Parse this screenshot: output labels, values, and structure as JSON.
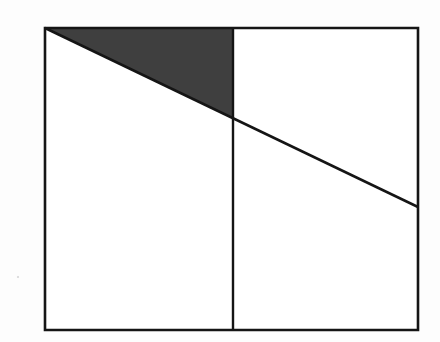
{
  "figure": {
    "canvas": {
      "width": 440,
      "height": 342,
      "background_color": "#fdfdfd"
    },
    "colors": {
      "stroke": "#151515",
      "shaded_fill": "#3f3f3f",
      "unshaded_fill": "#ffffff",
      "paper": "#fdfdfd"
    },
    "stroke_widths": {
      "outline": 2.6,
      "divider": 2.4,
      "diagonal": 2.5
    },
    "points": {
      "top_left": {
        "x": 45,
        "y": 28
      },
      "top_right": {
        "x": 418,
        "y": 28
      },
      "bottom_right": {
        "x": 418,
        "y": 330
      },
      "bottom_left": {
        "x": 45,
        "y": 330
      },
      "divider_top": {
        "x": 233,
        "y": 28
      },
      "divider_bottom": {
        "x": 233,
        "y": 330
      },
      "diagonal_start": {
        "x": 45,
        "y": 28
      },
      "diagonal_end": {
        "x": 418,
        "y": 207
      },
      "diagonal_divider_intersection": {
        "x": 233,
        "y": 118
      }
    },
    "shapes": {
      "outer_rectangle": {
        "label": "outer rectangle",
        "path": "M 45 28 L 418 28 L 418 330 L 45 330 Z",
        "filled": false
      },
      "vertical_divider": {
        "label": "vertical dividing line",
        "path": "M 233 28 L 233 330"
      },
      "diagonal_line": {
        "label": "diagonal line from top-left corner to right edge",
        "path": "M 45 28 L 418 207"
      },
      "shaded_triangle": {
        "label": "shaded triangle above the diagonal in the left panel",
        "path": "M 45 28 L 233 28 L 233 118 Z",
        "filled": true,
        "fill_color": "#3f3f3f",
        "vertices": [
          {
            "x": 45,
            "y": 28
          },
          {
            "x": 233,
            "y": 28
          },
          {
            "x": 233,
            "y": 118
          }
        ]
      }
    },
    "regions": [
      {
        "name": "shaded-triangle",
        "shaded": true
      },
      {
        "name": "left-panel-below-diagonal",
        "shaded": false
      },
      {
        "name": "right-panel-above-diagonal",
        "shaded": false
      },
      {
        "name": "right-panel-below-diagonal",
        "shaded": false
      }
    ]
  }
}
